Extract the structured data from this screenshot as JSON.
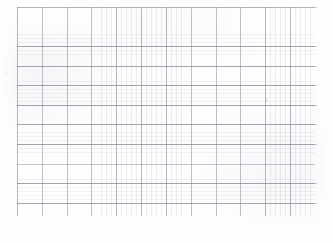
{
  "document": {
    "kind": "grid-sheet",
    "title": "",
    "description": "Faint scanned graph paper grid",
    "background_color": "#ffffff",
    "paper_color": "#fefefe"
  },
  "grid": {
    "major_line_color": "#78788a",
    "minor_line_color": "#9696a5",
    "origin_x": 17,
    "origin_y": 7,
    "width": 298,
    "height": 209,
    "major_columns": 13,
    "major_rows": 11,
    "major_column_spacing": 24.83,
    "major_row_spacing": 19.58,
    "minor_column_spacing": 4.97,
    "minor_row_spacing": 3.92,
    "minor_per_major_x": 5,
    "minor_per_major_y": 5
  },
  "marks": {
    "left_speck_label": "",
    "mid_speck_label": ""
  },
  "annotations": {
    "none": ""
  }
}
